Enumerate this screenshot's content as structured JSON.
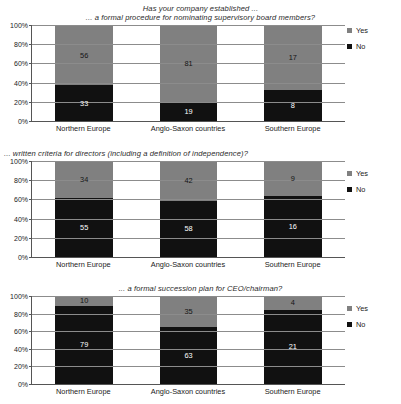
{
  "header": {
    "main_title": "Has your company established ...",
    "panel_titles": [
      "... a formal procedure for nominating supervisory board members?",
      "... written criteria for directors (including a definition of independence)?",
      "... a formal succession plan for CEO/chairman?"
    ]
  },
  "legend": {
    "yes_label": "Yes",
    "no_label": "No",
    "yes_color": "#808080",
    "no_color": "#111111"
  },
  "axis": {
    "yticks": [
      "100%",
      "80%",
      "60%",
      "40%",
      "20%",
      "0%"
    ],
    "categories": [
      "Northern Europe",
      "Anglo-Saxon countries",
      "Southern Europe"
    ]
  },
  "chart_data": [
    {
      "type": "bar",
      "title": "... a formal procedure for nominating supervisory board members?",
      "subtitle": "Has your company established ...",
      "stacked": true,
      "normalized_100pct": true,
      "categories": [
        "Northern Europe",
        "Anglo-Saxon countries",
        "Southern Europe"
      ],
      "series": [
        {
          "name": "Yes",
          "color": "#808080",
          "values": [
            56,
            81,
            17
          ]
        },
        {
          "name": "No",
          "color": "#111111",
          "values": [
            33,
            19,
            8
          ]
        }
      ],
      "xlabel": "",
      "ylabel": "",
      "ylim": [
        0,
        100
      ],
      "ytick_labels": [
        "0%",
        "20%",
        "40%",
        "60%",
        "80%",
        "100%"
      ],
      "grid": true,
      "legend_position": "right"
    },
    {
      "type": "bar",
      "title": "... written criteria for directors (including a definition of independence)?",
      "stacked": true,
      "normalized_100pct": true,
      "categories": [
        "Northern Europe",
        "Anglo-Saxon countries",
        "Southern Europe"
      ],
      "series": [
        {
          "name": "Yes",
          "color": "#808080",
          "values": [
            34,
            42,
            9
          ]
        },
        {
          "name": "No",
          "color": "#111111",
          "values": [
            55,
            58,
            16
          ]
        }
      ],
      "xlabel": "",
      "ylabel": "",
      "ylim": [
        0,
        100
      ],
      "ytick_labels": [
        "0%",
        "20%",
        "40%",
        "60%",
        "80%",
        "100%"
      ],
      "grid": true,
      "legend_position": "right"
    },
    {
      "type": "bar",
      "title": "... a formal succession plan for CEO/chairman?",
      "stacked": true,
      "normalized_100pct": true,
      "categories": [
        "Northern Europe",
        "Anglo-Saxon countries",
        "Southern Europe"
      ],
      "series": [
        {
          "name": "Yes",
          "color": "#808080",
          "values": [
            10,
            35,
            4
          ]
        },
        {
          "name": "No",
          "color": "#111111",
          "values": [
            79,
            63,
            21
          ]
        }
      ],
      "xlabel": "",
      "ylabel": "",
      "ylim": [
        0,
        100
      ],
      "ytick_labels": [
        "0%",
        "20%",
        "40%",
        "60%",
        "80%",
        "100%"
      ],
      "grid": true,
      "legend_position": "right"
    }
  ]
}
